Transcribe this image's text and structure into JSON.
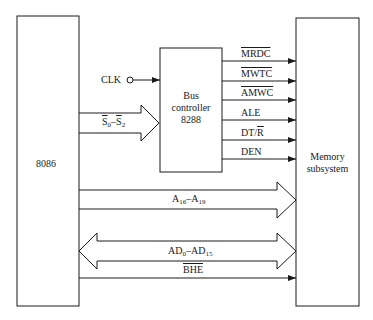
{
  "diagram": {
    "blocks": {
      "cpu": {
        "label": "8086"
      },
      "bus_controller": {
        "line1": "Bus",
        "line2": "controller",
        "line3": "8288"
      },
      "memory": {
        "line1": "Memory",
        "line2": "subsystem"
      }
    },
    "inputs": {
      "clk": "CLK",
      "status": {
        "base": "S",
        "from": "0",
        "sep": "–",
        "to": "2"
      }
    },
    "outputs": [
      {
        "label": "MRDC",
        "overline": true
      },
      {
        "label": "MWTC",
        "overline": true
      },
      {
        "label": "AMWC",
        "overline": true
      },
      {
        "label": "ALE",
        "overline": false
      },
      {
        "label": "DT/R",
        "overline_part": "R"
      },
      {
        "label": "DEN",
        "overline": false
      }
    ],
    "buses": {
      "address_high": {
        "base": "A",
        "from": "16",
        "sep": "–",
        "to": "19"
      },
      "address_data": {
        "base": "AD",
        "from": "0",
        "sep": "–",
        "to": "15"
      },
      "bhe": {
        "label": "BHE",
        "overline": true
      }
    },
    "colors": {
      "line": "#1a1a1a",
      "background": "#ffffff"
    }
  }
}
